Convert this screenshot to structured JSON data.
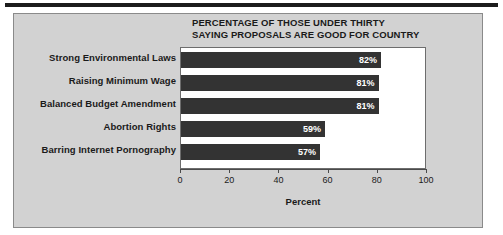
{
  "chart_data": {
    "type": "bar",
    "orientation": "horizontal",
    "title": "PERCENTAGE OF THOSE UNDER THIRTY SAYING PROPOSALS ARE GOOD FOR COUNTRY",
    "title_lines": [
      "PERCENTAGE OF THOSE UNDER THIRTY",
      "SAYING PROPOSALS ARE GOOD FOR COUNTRY"
    ],
    "categories": [
      "Strong Environmental Laws",
      "Raising Minimum Wage",
      "Balanced Budget Amendment",
      "Abortion Rights",
      "Barring Internet Pornography"
    ],
    "values": [
      82,
      81,
      81,
      59,
      57
    ],
    "value_labels": [
      "82%",
      "81%",
      "81%",
      "59%",
      "57%"
    ],
    "xlabel": "Percent",
    "ylabel": "",
    "xlim": [
      0,
      100
    ],
    "xticks": [
      0,
      20,
      40,
      60,
      80,
      100
    ],
    "xtick_labels": [
      "0",
      "20",
      "40",
      "60",
      "80",
      "100"
    ],
    "grid": false,
    "legend": false,
    "bar_color": "#333333",
    "value_label_color": "#ffffff",
    "plot_background": "#ffffff",
    "panel_background": "#d2d2d2"
  }
}
